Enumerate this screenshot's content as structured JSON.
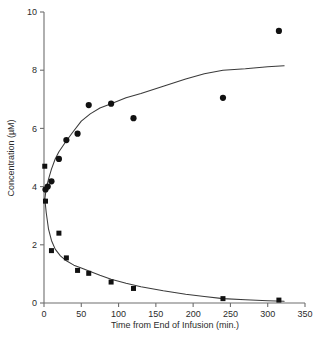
{
  "chart_data": {
    "type": "scatter",
    "title": "",
    "subtitle": "",
    "xlabel": "Time from End of Infusion (min.)",
    "ylabel": "Concentration (µM)",
    "xlim": [
      0,
      350
    ],
    "ylim": [
      0,
      10
    ],
    "xticks": [
      0,
      50,
      100,
      150,
      200,
      250,
      300,
      350
    ],
    "yticks": [
      0,
      2,
      4,
      6,
      8,
      10
    ],
    "xtick_labels": [
      "0",
      "50",
      "100",
      "150",
      "200",
      "250",
      "300",
      "350"
    ],
    "ytick_labels": [
      "0",
      "2",
      "4",
      "6",
      "8",
      "10"
    ],
    "grid": false,
    "legend": null,
    "legend_position": "none",
    "annotations": [],
    "series": [
      {
        "name": "Ascending metabolite (filled circles)",
        "marker": "circle",
        "marker_color": "#111111",
        "points": [
          {
            "x": 2,
            "y": 3.9
          },
          {
            "x": 5,
            "y": 4.0
          },
          {
            "x": 10,
            "y": 4.18
          },
          {
            "x": 20,
            "y": 4.95
          },
          {
            "x": 30,
            "y": 5.6
          },
          {
            "x": 45,
            "y": 5.82
          },
          {
            "x": 60,
            "y": 6.8
          },
          {
            "x": 90,
            "y": 6.85
          },
          {
            "x": 120,
            "y": 6.35
          },
          {
            "x": 240,
            "y": 7.05
          },
          {
            "x": 315,
            "y": 9.35
          }
        ]
      },
      {
        "name": "Declining parent drug (filled squares)",
        "marker": "square",
        "marker_color": "#111111",
        "points": [
          {
            "x": 1,
            "y": 4.7
          },
          {
            "x": 2,
            "y": 3.5
          },
          {
            "x": 10,
            "y": 1.8
          },
          {
            "x": 20,
            "y": 2.4
          },
          {
            "x": 30,
            "y": 1.55
          },
          {
            "x": 45,
            "y": 1.12
          },
          {
            "x": 60,
            "y": 1.02
          },
          {
            "x": 90,
            "y": 0.72
          },
          {
            "x": 120,
            "y": 0.5
          },
          {
            "x": 240,
            "y": 0.15
          },
          {
            "x": 315,
            "y": 0.1
          }
        ]
      },
      {
        "name": "Ascending fitted curve",
        "marker": "none",
        "line_color": "#3a3a3a",
        "points": [
          {
            "x": 1,
            "y": 3.55
          },
          {
            "x": 3,
            "y": 3.95
          },
          {
            "x": 6,
            "y": 4.25
          },
          {
            "x": 10,
            "y": 4.6
          },
          {
            "x": 15,
            "y": 4.95
          },
          {
            "x": 20,
            "y": 5.2
          },
          {
            "x": 28,
            "y": 5.5
          },
          {
            "x": 38,
            "y": 5.85
          },
          {
            "x": 50,
            "y": 6.25
          },
          {
            "x": 62,
            "y": 6.5
          },
          {
            "x": 75,
            "y": 6.7
          },
          {
            "x": 90,
            "y": 6.85
          },
          {
            "x": 110,
            "y": 7.05
          },
          {
            "x": 130,
            "y": 7.2
          },
          {
            "x": 160,
            "y": 7.45
          },
          {
            "x": 190,
            "y": 7.7
          },
          {
            "x": 215,
            "y": 7.88
          },
          {
            "x": 240,
            "y": 8.0
          },
          {
            "x": 270,
            "y": 8.05
          },
          {
            "x": 300,
            "y": 8.12
          },
          {
            "x": 322,
            "y": 8.15
          }
        ]
      },
      {
        "name": "Declining fitted curve",
        "marker": "none",
        "line_color": "#3a3a3a",
        "points": [
          {
            "x": 1,
            "y": 3.6
          },
          {
            "x": 3,
            "y": 3.1
          },
          {
            "x": 6,
            "y": 2.55
          },
          {
            "x": 10,
            "y": 2.15
          },
          {
            "x": 15,
            "y": 1.85
          },
          {
            "x": 22,
            "y": 1.62
          },
          {
            "x": 30,
            "y": 1.45
          },
          {
            "x": 40,
            "y": 1.3
          },
          {
            "x": 50,
            "y": 1.2
          },
          {
            "x": 62,
            "y": 1.08
          },
          {
            "x": 75,
            "y": 0.95
          },
          {
            "x": 90,
            "y": 0.82
          },
          {
            "x": 110,
            "y": 0.68
          },
          {
            "x": 130,
            "y": 0.56
          },
          {
            "x": 160,
            "y": 0.42
          },
          {
            "x": 190,
            "y": 0.3
          },
          {
            "x": 215,
            "y": 0.22
          },
          {
            "x": 240,
            "y": 0.15
          },
          {
            "x": 270,
            "y": 0.11
          },
          {
            "x": 300,
            "y": 0.08
          },
          {
            "x": 322,
            "y": 0.06
          }
        ]
      }
    ]
  }
}
